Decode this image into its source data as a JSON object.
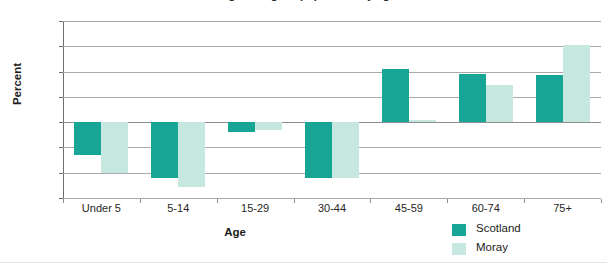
{
  "chart": {
    "title": "Percentage change in population by age band",
    "ylabel": "Percent",
    "xlabel": "Age"
  },
  "legend": {
    "items": [
      {
        "label": "Scotland",
        "color": "#17a596",
        "swatch": "legend-swatch-scotland"
      },
      {
        "label": "Moray",
        "color": "#c7e7e1",
        "swatch": "legend-swatch-moray"
      }
    ]
  },
  "yticks": [
    "40",
    "30",
    "20",
    "10",
    "0",
    "-10",
    "-20",
    "-30"
  ],
  "chart_data": {
    "type": "bar",
    "title": "Percentage change in population by age band",
    "xlabel": "Age",
    "ylabel": "Percent",
    "ylim": [
      -30,
      40
    ],
    "ytick_values": [
      40,
      30,
      20,
      10,
      0,
      -10,
      -20,
      -30
    ],
    "grid": true,
    "legend_position": "bottom-right",
    "categories": [
      "Under 5",
      "5-14",
      "15-29",
      "30-44",
      "45-59",
      "60-74",
      "75+"
    ],
    "series": [
      {
        "name": "Scotland",
        "color": "#17a596",
        "values": [
          -13,
          -22,
          -4,
          -22,
          21,
          19,
          18.5
        ]
      },
      {
        "name": "Moray",
        "color": "#c7e7e1",
        "values": [
          -20,
          -25.5,
          -3,
          -22,
          1,
          14.5,
          30.5
        ]
      }
    ]
  }
}
